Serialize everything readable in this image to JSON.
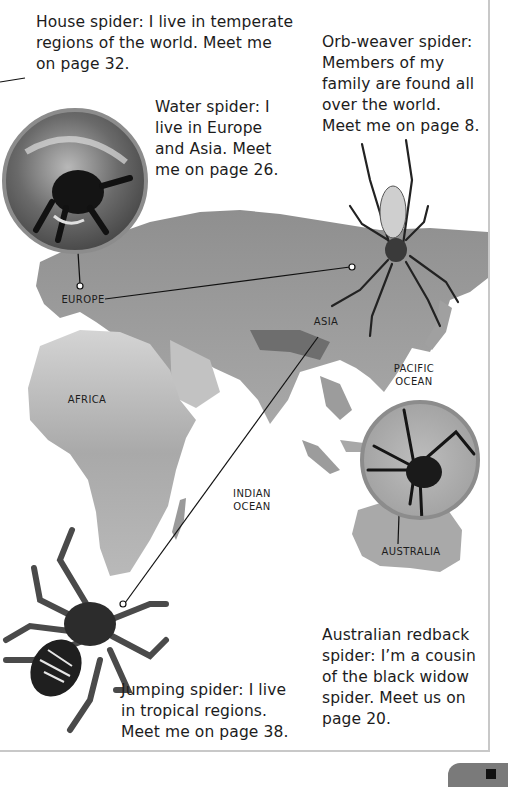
{
  "captions": {
    "house_spider": "House spider: I live in temperate regions of the world. Meet me on page 32.",
    "orb_weaver": "Orb-weaver spider: Members of my family are found all over the world. Meet me on page 8.",
    "water_spider": "Water spider: I live in Europe and Asia. Meet me on page 26.",
    "redback": "Australian redback spider: I’m a cousin of the black widow spider. Meet us on page 20.",
    "jumping_spider": "Jumping spider: I live in tropical regions. Meet me on page 38."
  },
  "caption_lines": {
    "house_spider": [
      "House spider: I live in temperate",
      "regions of the world. Meet me",
      "on page 32."
    ],
    "orb_weaver": [
      "Orb-weaver spider:",
      "Members of my",
      "family are found all",
      "over the world.",
      "Meet me on page 8."
    ],
    "water_spider": [
      "Water spider: I",
      "live in Europe",
      "and Asia. Meet",
      "me on page 26."
    ],
    "redback": [
      "Australian redback",
      "spider: I’m a cousin",
      "of the black widow",
      "spider. Meet us on",
      "page 20."
    ],
    "jumping_spider": [
      "Jumping spider: I live",
      "in tropical regions.",
      "Meet me on page 38."
    ]
  },
  "map_labels": {
    "europe": "EUROPE",
    "asia": "ASIA",
    "africa": "AFRICA",
    "pacific_1": "PACIFIC",
    "pacific_2": "OCEAN",
    "indian_1": "INDIAN",
    "indian_2": "OCEAN",
    "australia": "AUSTRALIA"
  },
  "colors": {
    "land": "#9a9a9a",
    "land_light": "#c9c9c9",
    "circle_border": "#8c8c8c",
    "text": "#1c1c1c",
    "page_tab": "#7a7a7a"
  }
}
